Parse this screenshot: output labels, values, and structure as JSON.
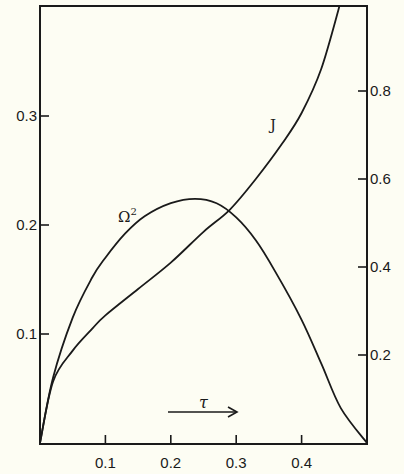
{
  "chart_data": {
    "type": "line",
    "title": "",
    "xlabel": "τ",
    "ylabel_left": "Ω²",
    "ylabel_right": "J",
    "xlim": [
      0,
      0.5
    ],
    "ylim_left": [
      0,
      0.4
    ],
    "ylim_right": [
      0,
      1.0
    ],
    "x_ticks": [
      "0.1",
      "0.2",
      "0.3",
      "0.4"
    ],
    "x_tick_values": [
      0.1,
      0.2,
      0.3,
      0.4
    ],
    "y_left_ticks": [
      "0.1",
      "0.2",
      "0.3"
    ],
    "y_left_tick_values": [
      0.1,
      0.2,
      0.3
    ],
    "y_right_ticks": [
      "0.2",
      "0.4",
      "0.6",
      "0.8"
    ],
    "y_right_tick_values": [
      0.2,
      0.4,
      0.6,
      0.8
    ],
    "grid": false,
    "legend": "inline curve labels",
    "series": [
      {
        "name": "Ω²",
        "axis": "left",
        "x": [
          0,
          0.02,
          0.05,
          0.08,
          0.1,
          0.13,
          0.16,
          0.2,
          0.237,
          0.27,
          0.3,
          0.33,
          0.36,
          0.4,
          0.43,
          0.46,
          0.5
        ],
        "values": [
          0,
          0.06,
          0.115,
          0.152,
          0.17,
          0.192,
          0.208,
          0.22,
          0.224,
          0.22,
          0.207,
          0.186,
          0.157,
          0.113,
          0.073,
          0.032,
          0
        ]
      },
      {
        "name": "J",
        "axis": "right",
        "x": [
          0,
          0.02,
          0.05,
          0.08,
          0.1,
          0.15,
          0.2,
          0.25,
          0.29,
          0.33,
          0.37,
          0.4,
          0.43,
          0.458
        ],
        "values": [
          0,
          0.14,
          0.21,
          0.26,
          0.29,
          0.35,
          0.41,
          0.48,
          0.53,
          0.6,
          0.68,
          0.75,
          0.85,
          0.995
        ]
      }
    ],
    "annotations": [
      {
        "text": "Ω²",
        "near": "peak of Ω² curve, left side"
      },
      {
        "text": "J",
        "near": "upper J curve"
      },
      {
        "text": "τ →",
        "near": "bottom center, direction of increasing τ"
      }
    ]
  },
  "labels": {
    "omega": "Ω",
    "omega_sup": "2",
    "j": "J",
    "tau": "τ"
  }
}
